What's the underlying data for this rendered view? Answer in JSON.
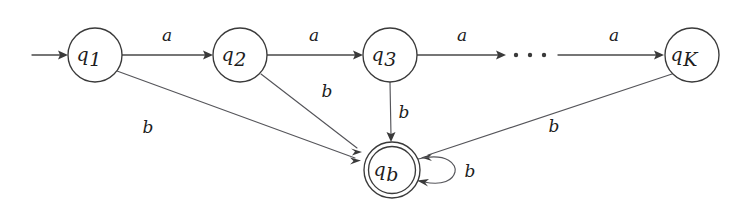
{
  "diagram": {
    "type": "finite-state-automaton",
    "background_color": "#ffffff",
    "stroke_color": "#3a3a3a",
    "text_color": "#1d1d1d",
    "states": [
      {
        "id": "q1",
        "base": "q",
        "subscript": "1",
        "cx": 95,
        "cy": 55,
        "r": 27,
        "accepting": false,
        "start": true
      },
      {
        "id": "q2",
        "base": "q",
        "subscript": "2",
        "cx": 240,
        "cy": 55,
        "r": 27,
        "accepting": false,
        "start": false
      },
      {
        "id": "q3",
        "base": "q",
        "subscript": "3",
        "cx": 390,
        "cy": 55,
        "r": 27,
        "accepting": false,
        "start": false
      },
      {
        "id": "qK",
        "base": "q",
        "subscript": "K",
        "cx": 692,
        "cy": 55,
        "r": 27,
        "accepting": false,
        "start": false
      },
      {
        "id": "qb",
        "base": "q",
        "subscript": "b",
        "cx": 392,
        "cy": 170,
        "r": 28,
        "accepting": true,
        "start": false
      }
    ],
    "start_arrow": {
      "from_x": 32,
      "to_x": 66,
      "y": 55
    },
    "ellipsis": {
      "x_positions": [
        516,
        530,
        544
      ],
      "y": 55,
      "radius": 2.2
    },
    "transitions": [
      {
        "id": "t-q1-q2",
        "from": "q1",
        "to": "q2",
        "symbol": "a",
        "label_x": 167,
        "label_y": 36,
        "kind": "horizontal"
      },
      {
        "id": "t-q2-q3",
        "from": "q2",
        "to": "q3",
        "symbol": "a",
        "label_x": 314,
        "label_y": 36,
        "kind": "horizontal"
      },
      {
        "id": "t-q3-dots",
        "from": "q3",
        "to": "ellipsis",
        "symbol": "a",
        "label_x": 462,
        "label_y": 36,
        "kind": "horizontal"
      },
      {
        "id": "t-dots-qK",
        "from": "ellipsis",
        "to": "qK",
        "symbol": "a",
        "label_x": 614,
        "label_y": 36,
        "kind": "horizontal"
      },
      {
        "id": "t-q1-qb",
        "from": "q1",
        "to": "qb",
        "symbol": "b",
        "label_x": 148,
        "label_y": 128,
        "kind": "diagonal"
      },
      {
        "id": "t-q2-qb",
        "from": "q2",
        "to": "qb",
        "symbol": "b",
        "label_x": 327,
        "label_y": 92,
        "kind": "diagonal"
      },
      {
        "id": "t-q3-qb",
        "from": "q3",
        "to": "qb",
        "symbol": "b",
        "label_x": 404,
        "label_y": 113,
        "kind": "vertical"
      },
      {
        "id": "t-qK-qb",
        "from": "qK",
        "to": "qb",
        "symbol": "b",
        "label_x": 554,
        "label_y": 127,
        "kind": "diagonal"
      },
      {
        "id": "t-qb-qb",
        "from": "qb",
        "to": "qb",
        "symbol": "b",
        "label_x": 470,
        "label_y": 172,
        "kind": "self-loop"
      }
    ],
    "alphabet": [
      "a",
      "b"
    ],
    "accepting_states": [
      "qb"
    ],
    "start_state": "q1"
  }
}
